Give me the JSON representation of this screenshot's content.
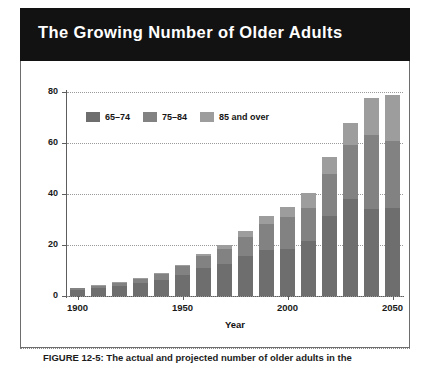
{
  "figure": {
    "banner_title": "The Growing Number of Older Adults",
    "caption": "FIGURE 12-5: The actual and projected number of older adults in the"
  },
  "chart_data": {
    "type": "bar",
    "stacked": true,
    "title": "The Growing Number of Older Adults",
    "xlabel": "Year",
    "ylabel": "Population in millions",
    "ylim": [
      0,
      80
    ],
    "yticks": [
      0,
      20,
      40,
      60,
      80
    ],
    "xticks": [
      1900,
      1950,
      2000,
      2050
    ],
    "grid": true,
    "legend_position": "top-left-inside",
    "categories": [
      1900,
      1910,
      1920,
      1930,
      1940,
      1950,
      1960,
      1970,
      1980,
      1990,
      2000,
      2010,
      2020,
      2030,
      2040,
      2050
    ],
    "series": [
      {
        "name": "65-74",
        "color": "#6e6e6e",
        "values": [
          2.2,
          3.0,
          4.0,
          5.0,
          6.4,
          8.4,
          11.0,
          12.4,
          15.6,
          18.1,
          18.4,
          21.7,
          31.4,
          38.0,
          34.1,
          34.7
        ]
      },
      {
        "name": "75-84",
        "color": "#828282",
        "values": [
          0.8,
          1.0,
          1.3,
          1.8,
          2.3,
          3.3,
          4.6,
          6.1,
          7.7,
          10.1,
          12.4,
          13.0,
          16.5,
          21.2,
          29.2,
          26.0
        ]
      },
      {
        "name": "85 and over",
        "color": "#9d9d9d",
        "values": [
          0.1,
          0.2,
          0.3,
          0.4,
          0.4,
          0.6,
          0.9,
          1.5,
          2.2,
          3.1,
          4.2,
          5.8,
          6.6,
          8.8,
          14.2,
          18.2
        ]
      }
    ],
    "totals": [
      3.1,
      4.2,
      5.6,
      7.2,
      9.1,
      12.3,
      16.5,
      20.0,
      25.5,
      31.3,
      35.0,
      40.5,
      54.5,
      68.0,
      77.5,
      78.9
    ]
  },
  "legend": {
    "items": [
      {
        "label": "65–74",
        "color": "#6e6e6e"
      },
      {
        "label": "75–84",
        "color": "#828282"
      },
      {
        "label": "85 and over",
        "color": "#9d9d9d"
      }
    ]
  }
}
